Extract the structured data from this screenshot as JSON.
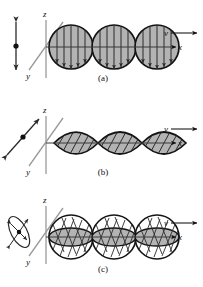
{
  "figure": {
    "background_color": "#ffffff",
    "ink_color": "#111111",
    "axis_color": "#8c8c8c",
    "wave_fill": "#b0b0b0",
    "wave_stroke": "#1a1a1a",
    "width": 203,
    "height": 287
  },
  "panels": [
    {
      "id": "a",
      "caption": "(a)",
      "polarization": "linear vertical",
      "indicator": "vertical double-headed arrow",
      "shape": "circle",
      "shape_count": 3,
      "internal_lines": "vertical double-headed arrows",
      "axes": {
        "z": "z",
        "y": "y",
        "x": "x"
      },
      "velocity_label": "v"
    },
    {
      "id": "b",
      "caption": "(b)",
      "polarization": "linear diagonal",
      "indicator": "diagonal double-headed arrow",
      "shape": "lens",
      "shape_count": 3,
      "internal_lines": "diagonal parallel lines",
      "axes": {
        "z": "z",
        "y": "y",
        "x": "x"
      },
      "velocity_label": "v"
    },
    {
      "id": "c",
      "caption": "(c)",
      "polarization": "circular / elliptical",
      "indicator": "tilted ellipse with rotation arrows",
      "shape": "circle with inscribed ellipse",
      "shape_count": 3,
      "internal_lines": "helical cross-hatching",
      "axes": {
        "z": "z",
        "y": "y",
        "x": "x"
      },
      "velocity_label": "v"
    }
  ],
  "labels": {
    "axis_z": "z",
    "axis_y": "y",
    "axis_x": "x",
    "velocity": "v",
    "caption_a": "(a)",
    "caption_b": "(b)",
    "caption_c": "(c)"
  }
}
